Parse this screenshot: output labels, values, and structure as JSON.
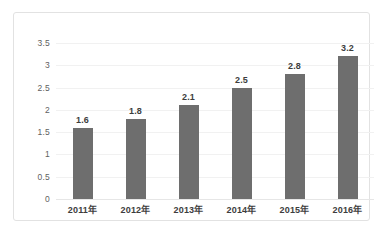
{
  "chart_data": {
    "type": "bar",
    "title": "",
    "subtitle": "",
    "xlabel": "",
    "ylabel": "",
    "categories": [
      "2011年",
      "2012年",
      "2013年",
      "2014年",
      "2015年",
      "2016年"
    ],
    "values": [
      1.6,
      1.8,
      2.1,
      2.5,
      2.8,
      3.2
    ],
    "value_labels": [
      "1.6",
      "1.8",
      "2.1",
      "2.5",
      "2.8",
      "3.2"
    ],
    "ylim": [
      0,
      3.5
    ],
    "y_ticks": [
      0,
      0.5,
      1,
      1.5,
      2,
      2.5,
      3,
      3.5
    ],
    "y_tick_labels": [
      "0",
      "0.5",
      "1",
      "1.5",
      "2",
      "2.5",
      "3",
      "3.5"
    ],
    "grid": true,
    "legend": false,
    "legend_position": "none",
    "series": [
      {
        "name": "",
        "values": [
          1.6,
          1.8,
          2.1,
          2.5,
          2.8,
          3.2
        ]
      }
    ],
    "colors": {
      "bar": "#6e6e6e",
      "gridline": "#f1f1f1",
      "baseline": "#e6e6e6",
      "frame_border": "#e2e2e2",
      "tick_text": "#5f5f5f",
      "label_text": "#3d3d3d",
      "background": "#ffffff"
    }
  }
}
